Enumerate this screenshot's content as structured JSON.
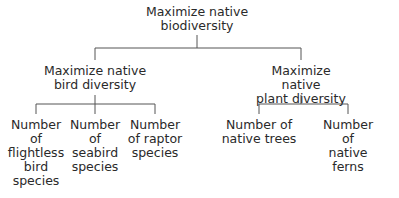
{
  "diagram": {
    "type": "hierarchy",
    "root": {
      "label": "Maximize native\nbiodiversity",
      "children": [
        {
          "label": "Maximize native\nbird diversity",
          "children": [
            {
              "label": "Number\nof\nflightless\nbird\nspecies"
            },
            {
              "label": "Number\nof\nseabird\nspecies"
            },
            {
              "label": "Number\nof raptor\nspecies"
            }
          ]
        },
        {
          "label": "Maximize native\nplant diversity",
          "children": [
            {
              "label": "Number of\nnative trees"
            },
            {
              "label": "Number of\nnative ferns"
            }
          ]
        }
      ]
    },
    "line_color": "#555555"
  }
}
